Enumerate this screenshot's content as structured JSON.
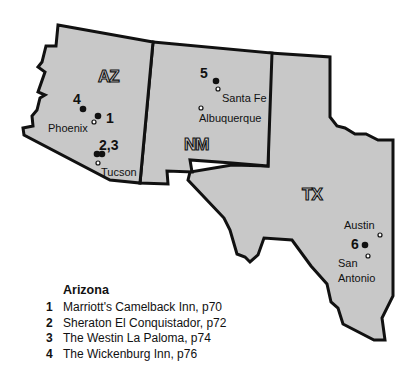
{
  "colors": {
    "land": "#c8c8c8",
    "border": "#111111",
    "background": "#ffffff"
  },
  "states": [
    {
      "abbr": "AZ",
      "label_x": 98,
      "label_y": 82
    },
    {
      "abbr": "NM",
      "label_x": 186,
      "label_y": 150
    },
    {
      "abbr": "TX",
      "label_x": 303,
      "label_y": 200
    }
  ],
  "cities": [
    {
      "name": "Phoenix",
      "dot_x": 94,
      "dot_y": 122,
      "label_x": 48,
      "label_y": 132
    },
    {
      "name": "Tucson",
      "dot_x": 98,
      "dot_y": 162,
      "label_x": 101,
      "label_y": 175
    },
    {
      "name": "Santa Fe",
      "dot_x": 218,
      "dot_y": 89,
      "label_x": 222,
      "label_y": 102
    },
    {
      "name": "Albuquerque",
      "dot_x": 201,
      "dot_y": 108,
      "label_x": 199,
      "label_y": 122
    },
    {
      "name": "Austin",
      "dot_x": 380,
      "dot_y": 235,
      "label_x": 344,
      "label_y": 229
    },
    {
      "name": "San Antonio",
      "label_line1": "San",
      "label_line2": "Antonio",
      "dot_x": 368,
      "dot_y": 255,
      "label_x": 337,
      "label_y": 267
    }
  ],
  "hotel_markers": [
    {
      "number": "1",
      "dot_x": 98,
      "dot_y": 117,
      "label_x": 106,
      "label_y": 123
    },
    {
      "number": "2,3",
      "dot_x": 99,
      "dot_y": 153,
      "label_x": 99,
      "label_y": 150
    },
    {
      "number": "4",
      "dot_x": 83,
      "dot_y": 109,
      "label_x": 73,
      "label_y": 104
    },
    {
      "number": "5",
      "dot_x": 216,
      "dot_y": 81,
      "label_x": 200,
      "label_y": 78
    },
    {
      "number": "6",
      "dot_x": 365,
      "dot_y": 245,
      "label_x": 351,
      "label_y": 248
    }
  ],
  "legend": {
    "title": "Arizona",
    "items": [
      {
        "number": "1",
        "text": "Marriott's Camelback Inn, p70"
      },
      {
        "number": "2",
        "text": "Sheraton El Conquistador, p72"
      },
      {
        "number": "3",
        "text": "The Westin La Paloma, p74"
      },
      {
        "number": "4",
        "text": "The Wickenburg Inn, p76"
      }
    ]
  }
}
